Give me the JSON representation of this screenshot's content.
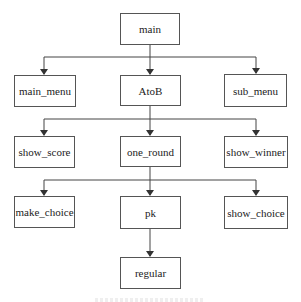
{
  "diagram": {
    "type": "call-hierarchy-tree",
    "nodes": [
      {
        "id": "main",
        "label": "main",
        "x": 120,
        "y": 13,
        "w": 60,
        "h": 32
      },
      {
        "id": "main_menu",
        "label": "main_menu",
        "x": 14,
        "y": 75,
        "w": 62,
        "h": 32
      },
      {
        "id": "AtoB",
        "label": "AtoB",
        "x": 120,
        "y": 75,
        "w": 61,
        "h": 31
      },
      {
        "id": "sub_menu",
        "label": "sub_menu",
        "x": 224,
        "y": 74,
        "w": 63,
        "h": 33
      },
      {
        "id": "show_score",
        "label": "show_score",
        "x": 14,
        "y": 136,
        "w": 61,
        "h": 32
      },
      {
        "id": "one_round",
        "label": "one_round",
        "x": 120,
        "y": 136,
        "w": 61,
        "h": 31
      },
      {
        "id": "show_winner",
        "label": "show_winner",
        "x": 224,
        "y": 136,
        "w": 64,
        "h": 32
      },
      {
        "id": "make_choice",
        "label": "make_choice",
        "x": 14,
        "y": 196,
        "w": 61,
        "h": 32
      },
      {
        "id": "pk",
        "label": "pk",
        "x": 120,
        "y": 196,
        "w": 61,
        "h": 33
      },
      {
        "id": "show_choice",
        "label": "show_choice",
        "x": 224,
        "y": 196,
        "w": 64,
        "h": 33
      },
      {
        "id": "regular",
        "label": "regular",
        "x": 120,
        "y": 257,
        "w": 61,
        "h": 32
      }
    ],
    "edges": [
      {
        "from": "main",
        "to": "main_menu"
      },
      {
        "from": "main",
        "to": "AtoB"
      },
      {
        "from": "main",
        "to": "sub_menu"
      },
      {
        "from": "AtoB",
        "to": "show_score"
      },
      {
        "from": "AtoB",
        "to": "one_round"
      },
      {
        "from": "AtoB",
        "to": "show_winner"
      },
      {
        "from": "one_round",
        "to": "make_choice"
      },
      {
        "from": "one_round",
        "to": "pk"
      },
      {
        "from": "one_round",
        "to": "show_choice"
      },
      {
        "from": "pk",
        "to": "regular"
      }
    ],
    "colors": {
      "line": "#444444",
      "border": "#555555",
      "text": "#222222",
      "background": "#ffffff"
    }
  }
}
